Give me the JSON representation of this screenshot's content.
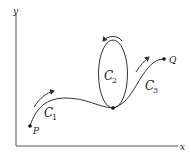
{
  "diagram": {
    "axes": {
      "x_label": "x",
      "y_label": "y"
    },
    "points": [
      {
        "id": "P",
        "label": "P"
      },
      {
        "id": "junction",
        "label": ""
      },
      {
        "id": "Q",
        "label": "Q"
      }
    ],
    "curves": [
      {
        "id": "C1",
        "label": "C",
        "subscript": "1",
        "description": "from P to junction, arrow pointing along direction of travel"
      },
      {
        "id": "C2",
        "label": "C",
        "subscript": "2",
        "description": "closed loop (ellipse) starting and ending at junction, counterclockwise arrow on top"
      },
      {
        "id": "C3",
        "label": "C",
        "subscript": "3",
        "description": "from junction to Q, arrow pointing along direction of travel"
      }
    ],
    "colors": {
      "stroke": "#333333",
      "background": "#ffffff"
    }
  }
}
